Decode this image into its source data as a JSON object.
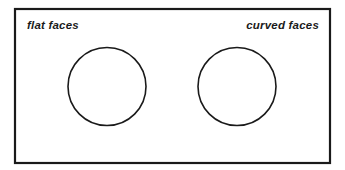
{
  "figure": {
    "type": "venn-diagram",
    "title": "",
    "background_color": "#ffffff",
    "stroke_color": "#1a1a1a",
    "border": {
      "x": 15,
      "y": 9,
      "width": 315,
      "height": 154,
      "stroke_width": 2.2
    },
    "circles": [
      {
        "id": "left-circle",
        "label": "flat faces",
        "cx": 107,
        "cy": 86.5,
        "r": 39,
        "stroke_width": 1.6,
        "fill": "none"
      },
      {
        "id": "right-circle",
        "label": "curved faces",
        "cx": 237,
        "cy": 86.5,
        "r": 39,
        "stroke_width": 1.6,
        "fill": "none"
      }
    ],
    "labels": {
      "left": {
        "text": "flat faces",
        "x": 27,
        "y": 29,
        "anchor": "start"
      },
      "right": {
        "text": "curved faces",
        "x": 319,
        "y": 29,
        "anchor": "end"
      }
    },
    "intersections": [
      {
        "x": 172,
        "y": 33
      },
      {
        "x": 172,
        "y": 140
      }
    ]
  }
}
